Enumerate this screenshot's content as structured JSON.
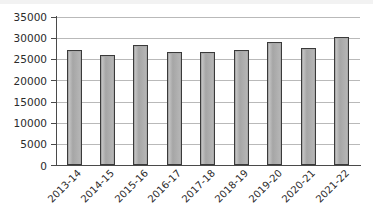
{
  "chart_data": {
    "type": "bar",
    "title": "",
    "subtitle": "",
    "xlabel": "",
    "ylabel": "",
    "categories": [
      "2013-14",
      "2014-15",
      "2015-16",
      "2016-17",
      "2017-18",
      "2018-19",
      "2019-20",
      "2020-21",
      "2021-22"
    ],
    "values": [
      27200,
      26100,
      28300,
      26700,
      26700,
      27200,
      29200,
      27600,
      30200
    ],
    "series": [
      {
        "name": "",
        "values": [
          27200,
          26100,
          28300,
          26700,
          26700,
          27200,
          29200,
          27600,
          30200
        ]
      }
    ],
    "ylim": [
      0,
      35000
    ],
    "ytick_values": [
      0,
      5000,
      10000,
      15000,
      20000,
      25000,
      30000,
      35000
    ],
    "ytick_labels": [
      "0",
      "5000",
      "10000",
      "15000",
      "20000",
      "25000",
      "30000",
      "35000"
    ],
    "grid": true,
    "grid_axis": "y",
    "legend": false,
    "legend_position": "none",
    "annotations": [],
    "bar_fill_color": "#a9a9a9",
    "bar_edge_color": "#3a3a3a",
    "gridline_color": "#b9b9b9",
    "axis_color": "#4a4a4a",
    "background_color": "#ffffff",
    "xtick_label_rotation": -45
  }
}
